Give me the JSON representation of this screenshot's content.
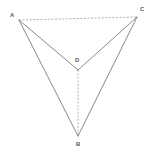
{
  "figure": {
    "type": "geometry-diagram",
    "width": 151,
    "height": 152,
    "background_color": "#ffffff",
    "solid_stroke_color": "#6b6b6b",
    "dashed_stroke_color": "#9a9a9a",
    "label_color": "#5a5a5a",
    "vertices": [
      {
        "id": "A",
        "label": "A",
        "x": 19,
        "y": 20,
        "label_x": 10,
        "label_y": 12
      },
      {
        "id": "C",
        "label": "C",
        "x": 137,
        "y": 17,
        "label_x": 140,
        "label_y": 6
      },
      {
        "id": "D",
        "label": "D",
        "x": 78,
        "y": 70,
        "label_x": 75,
        "label_y": 57
      },
      {
        "id": "B",
        "label": "B",
        "x": 78,
        "y": 136,
        "label_x": 76,
        "label_y": 141
      }
    ],
    "edges": [
      {
        "id": "AC",
        "from": "A",
        "to": "C",
        "style": "dashed",
        "x1": 19,
        "y1": 20,
        "x2": 137,
        "y2": 17
      },
      {
        "id": "AD",
        "from": "A",
        "to": "D",
        "style": "solid",
        "x1": 19,
        "y1": 20,
        "x2": 78,
        "y2": 70
      },
      {
        "id": "CD",
        "from": "C",
        "to": "D",
        "style": "solid",
        "x1": 137,
        "y1": 17,
        "x2": 78,
        "y2": 70
      },
      {
        "id": "AB",
        "from": "A",
        "to": "B",
        "style": "solid",
        "x1": 19,
        "y1": 20,
        "x2": 78,
        "y2": 136
      },
      {
        "id": "CB",
        "from": "C",
        "to": "B",
        "style": "solid",
        "x1": 137,
        "y1": 17,
        "x2": 78,
        "y2": 136
      },
      {
        "id": "DB",
        "from": "D",
        "to": "B",
        "style": "dashed",
        "x1": 78,
        "y1": 70,
        "x2": 78,
        "y2": 136
      }
    ]
  }
}
